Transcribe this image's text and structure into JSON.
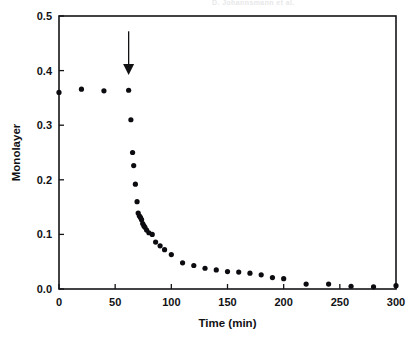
{
  "header": {
    "artifact_text": "D. Johannsmann et al."
  },
  "figure": {
    "name": "monolayer-desorption-kinetics-plot",
    "background_color": "#ffffff",
    "ink_color": "#111114",
    "marker_color": "#0c0c10"
  },
  "annotations": [
    {
      "name": "injection-arrow",
      "type": "down-arrow",
      "x_value": 62,
      "y_top_value": 0.472,
      "y_tip_value": 0.392,
      "label": ""
    }
  ],
  "chart_data": {
    "type": "scatter",
    "title": "",
    "subtitle": "",
    "xlabel": "Time (min)",
    "ylabel": "Monolayer",
    "xlim": [
      0,
      300
    ],
    "ylim": [
      0,
      0.5
    ],
    "xticks": [
      0,
      50,
      100,
      150,
      200,
      250,
      300
    ],
    "yticks": [
      0.0,
      0.1,
      0.2,
      0.3,
      0.4,
      0.5
    ],
    "xtick_labels": [
      "0",
      "50",
      "100",
      "150",
      "200",
      "250",
      "300"
    ],
    "ytick_labels": [
      "0.0",
      "0.1",
      "0.2",
      "0.3",
      "0.4",
      "0.5"
    ],
    "grid": false,
    "legend": null,
    "legend_position": "none",
    "marker": "filled-circle",
    "marker_size_px": 5.2,
    "series": [
      {
        "name": "Monolayer coverage",
        "x": [
          0,
          20,
          40,
          62,
          64,
          65.5,
          66.5,
          68,
          69.5,
          70.5,
          71.5,
          72.5,
          73.5,
          74.5,
          75.5,
          76.5,
          78,
          80,
          83,
          86,
          90,
          94,
          100,
          110,
          120,
          130,
          140,
          150,
          160,
          170,
          180,
          190,
          200,
          220,
          240,
          260,
          280,
          300
        ],
        "y": [
          0.36,
          0.366,
          0.363,
          0.364,
          0.31,
          0.25,
          0.226,
          0.192,
          0.16,
          0.139,
          0.134,
          0.131,
          0.127,
          0.12,
          0.116,
          0.113,
          0.108,
          0.103,
          0.1,
          0.086,
          0.079,
          0.072,
          0.063,
          0.048,
          0.043,
          0.038,
          0.035,
          0.032,
          0.031,
          0.029,
          0.026,
          0.021,
          0.019,
          0.009,
          0.009,
          0.005,
          0.004,
          0.006
        ]
      }
    ]
  }
}
